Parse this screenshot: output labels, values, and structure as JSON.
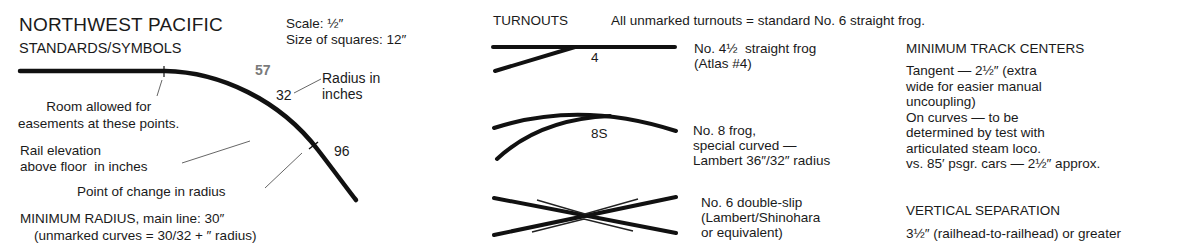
{
  "legend": {
    "title": "NORTHWEST PACIFIC",
    "subtitle": "STANDARDS/SYMBOLS",
    "scale": "Scale: ½″",
    "squares": "Size of squares: 12″",
    "elevation_value": "57",
    "radius_value_1": "32",
    "radius_label": "Radius in\ninches",
    "radius_value_2": "96",
    "easement_note": "Room allowed for\neasements at these points.",
    "elevation_note": "Rail elevation\nabove floor  in inches",
    "change_note": "Point of change in radius",
    "min_radius": "MINIMUM RADIUS, main line: 30″",
    "min_radius_note": "(unmarked curves  =  30/32 + ″ radius)"
  },
  "turnouts": {
    "heading": "TURNOUTS",
    "default_note": "All unmarked turnouts  =  standard No. 6 straight frog.",
    "items": [
      {
        "symbol_label": "4",
        "description": "No. 4½  straight frog\n(Atlas #4)"
      },
      {
        "symbol_label": "8S",
        "description": "No. 8 frog,\nspecial curved —\nLambert 36″/32″ radius"
      },
      {
        "symbol_label": "",
        "description": "No. 6 double-slip\n(Lambert/Shinohara\nor equivalent)"
      }
    ]
  },
  "track_centers": {
    "heading": "MINIMUM TRACK CENTERS",
    "body": "Tangent — 2½″ (extra\nwide for easier manual\nuncoupling)\nOn curves — to be\ndetermined by test with\narticulated steam loco.\nvs. 85′ psgr. cars — 2½″ approx."
  },
  "vertical_separation": {
    "heading": "VERTICAL SEPARATION",
    "body": "3½″ (railhead-to-railhead) or greater"
  },
  "colors": {
    "ink": "#1a1a1a",
    "gray_number": "#7a7a7a",
    "background": "#ffffff"
  }
}
